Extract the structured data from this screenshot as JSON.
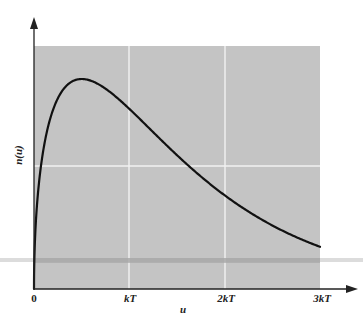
{
  "chart_data": {
    "type": "line",
    "title": "",
    "xlabel": "u",
    "ylabel": "n(u)",
    "x_ticks": [
      0,
      1,
      2,
      3
    ],
    "x_tick_labels": [
      "0",
      "kT",
      "2kT",
      "3kT"
    ],
    "xlim": [
      0,
      3
    ],
    "ylim": [
      0,
      1.12
    ],
    "grid": true,
    "legend": null,
    "background": "#c4c4c4",
    "gridline_color": "#f2f2f2",
    "line_color": "#111111",
    "series": [
      {
        "name": "n(u)",
        "description": "Maxwell–Boltzmann energy distribution, proportional to sqrt(u)·exp(-u/kT), normalized to peak = 1",
        "x": [
          0,
          0.02,
          0.05,
          0.1,
          0.2,
          0.3,
          0.4,
          0.5,
          0.6,
          0.7,
          0.8,
          1.0,
          1.2,
          1.4,
          1.6,
          1.8,
          2.0,
          2.2,
          2.4,
          2.6,
          2.8,
          3.0
        ],
        "y": [
          0,
          0.323,
          0.496,
          0.671,
          0.853,
          0.946,
          0.99,
          1.0,
          0.99,
          0.963,
          0.929,
          0.858,
          0.77,
          0.681,
          0.596,
          0.516,
          0.446,
          0.383,
          0.328,
          0.28,
          0.238,
          0.201
        ]
      }
    ]
  },
  "labels": {
    "x_axis": "u",
    "y_axis": "n(u)",
    "tick_0": "0",
    "tick_1": "kT",
    "tick_2": "2kT",
    "tick_3": "3kT"
  }
}
